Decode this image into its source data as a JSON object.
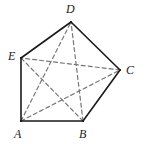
{
  "figure": {
    "width": 141,
    "height": 150,
    "background_color": "#ffffff",
    "edge_color": "#1a1a1a",
    "diagonal_color": "#777777",
    "edge_width": 1.6,
    "diagonal_width": 1.2,
    "diagonal_dash": "4 3",
    "label_color": "#1a1a1a",
    "vertices": [
      {
        "id": "A",
        "label": "A",
        "x": 21,
        "y": 121,
        "label_x": 14,
        "label_y": 128
      },
      {
        "id": "B",
        "label": "B",
        "x": 83,
        "y": 121,
        "label_x": 79,
        "label_y": 128
      },
      {
        "id": "C",
        "label": "C",
        "x": 120,
        "y": 70,
        "label_x": 126,
        "label_y": 64
      },
      {
        "id": "D",
        "label": "D",
        "x": 71,
        "y": 22,
        "label_x": 66,
        "label_y": 3
      },
      {
        "id": "E",
        "label": "E",
        "x": 21,
        "y": 58,
        "label_x": 8,
        "label_y": 50
      }
    ],
    "edges": [
      {
        "name": "edge-A-B",
        "from": "A",
        "to": "B",
        "style": "solid"
      },
      {
        "name": "edge-B-C",
        "from": "B",
        "to": "C",
        "style": "solid"
      },
      {
        "name": "edge-C-D",
        "from": "C",
        "to": "D",
        "style": "solid"
      },
      {
        "name": "edge-D-E",
        "from": "D",
        "to": "E",
        "style": "solid"
      },
      {
        "name": "edge-E-A",
        "from": "E",
        "to": "A",
        "style": "solid"
      }
    ],
    "diagonals": [
      {
        "name": "diagonal-A-C",
        "from": "A",
        "to": "C",
        "style": "dashed"
      },
      {
        "name": "diagonal-A-D",
        "from": "A",
        "to": "D",
        "style": "dashed"
      },
      {
        "name": "diagonal-B-D",
        "from": "B",
        "to": "D",
        "style": "dashed"
      },
      {
        "name": "diagonal-B-E",
        "from": "B",
        "to": "E",
        "style": "dashed"
      },
      {
        "name": "diagonal-C-E",
        "from": "C",
        "to": "E",
        "style": "dashed"
      }
    ]
  }
}
